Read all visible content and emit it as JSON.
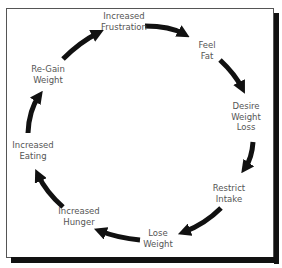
{
  "diagram": {
    "type": "cycle",
    "title": "",
    "colors": {
      "arrow": "#111111",
      "text": "#555555",
      "frame": "#555555",
      "shadow": "#111111"
    },
    "nodes": [
      {
        "id": "frustration",
        "lines": [
          "Increased",
          "Frustration"
        ]
      },
      {
        "id": "feel_fat",
        "lines": [
          "Feel",
          "Fat"
        ]
      },
      {
        "id": "desire",
        "lines": [
          "Desire",
          "Weight",
          "Loss"
        ]
      },
      {
        "id": "restrict",
        "lines": [
          "Restrict",
          "Intake"
        ]
      },
      {
        "id": "lose",
        "lines": [
          "Lose",
          "Weight"
        ]
      },
      {
        "id": "hunger",
        "lines": [
          "Increased",
          "Hunger"
        ]
      },
      {
        "id": "eating",
        "lines": [
          "Increased",
          "Eating"
        ]
      },
      {
        "id": "regain",
        "lines": [
          "Re-Gain",
          "Weight"
        ]
      }
    ],
    "edges": [
      {
        "from": "frustration",
        "to": "feel_fat"
      },
      {
        "from": "feel_fat",
        "to": "desire"
      },
      {
        "from": "desire",
        "to": "restrict"
      },
      {
        "from": "restrict",
        "to": "lose"
      },
      {
        "from": "lose",
        "to": "hunger"
      },
      {
        "from": "hunger",
        "to": "eating"
      },
      {
        "from": "eating",
        "to": "regain"
      },
      {
        "from": "regain",
        "to": "frustration"
      }
    ]
  }
}
